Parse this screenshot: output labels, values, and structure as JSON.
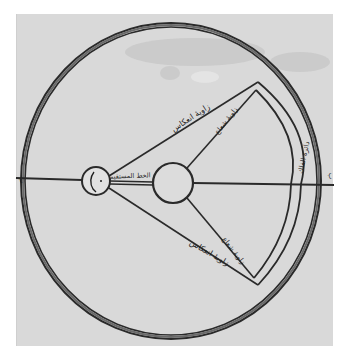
{
  "figure": {
    "type": "manuscript-optics-diagram",
    "script": "Arabic",
    "colors": {
      "paper": "#d9d9d9",
      "ink": "#2a2a2a",
      "page_margin": "#ffffff"
    }
  },
  "labels": {
    "angle_of_reflection": "زاويهٔ انعكاس",
    "angle_of_incidence_upper": "زاويهٔ شعاع",
    "angle_of_incidence_lower": "زاويهٔ شعاع",
    "angle_of_reflection_lower": "زاويهٔ انعكاس",
    "straight_line": "الخط المستقيم",
    "outer_circle_label": "دائرة الفلك",
    "left_margin_mark": "ب",
    "right_margin_mark": "ب",
    "eye_glyph": "ن"
  },
  "elements": {
    "outer_circle": {
      "cx": 171,
      "cy": 181,
      "rx": 150,
      "ry": 158
    },
    "eye_circle": {
      "cx": 96,
      "cy": 181,
      "r": 14
    },
    "mirror_circle": {
      "cx": 173,
      "cy": 183,
      "r": 20
    },
    "fan_apex_top": {
      "x": 258,
      "y": 82
    },
    "fan_apex_bottom": {
      "x": 258,
      "y": 285
    }
  }
}
